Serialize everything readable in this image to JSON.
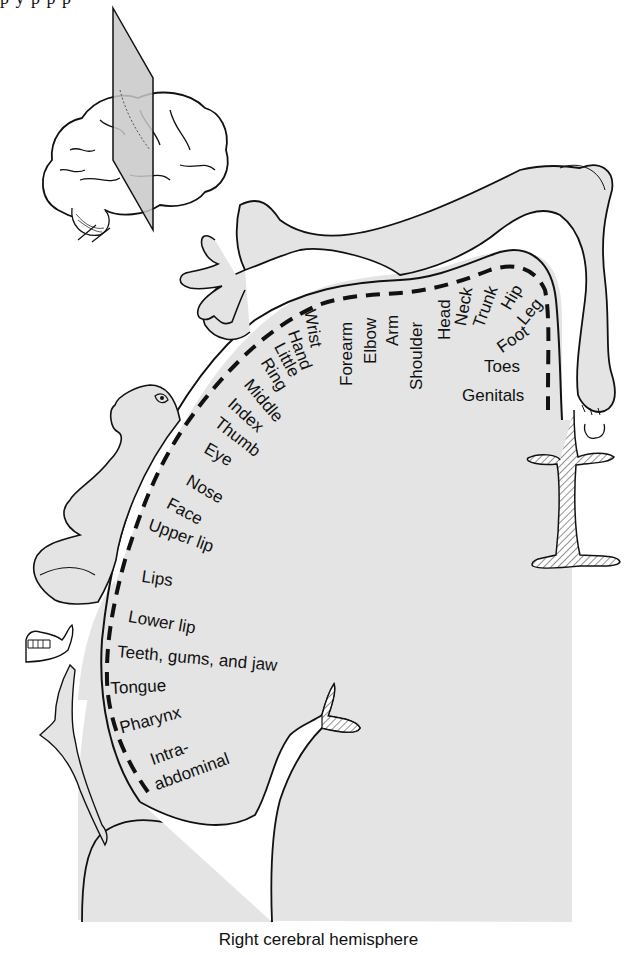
{
  "figure": {
    "caption": "Right cerebral hemisphere",
    "top_cut_text": "p                        y p                     p     p",
    "colors": {
      "cortex_fill": "#e4e4e4",
      "outline": "#111111",
      "background": "#ffffff",
      "plane": "#c8c8c8",
      "label_text": "#111111"
    }
  },
  "inset": {
    "name": "Brain lateral view with coronal plane",
    "plane_label": ""
  },
  "body_map_labels": [
    {
      "id": "genitals",
      "text": "Genitals"
    },
    {
      "id": "toes",
      "text": "Toes"
    },
    {
      "id": "foot",
      "text": "Foot"
    },
    {
      "id": "leg",
      "text": "Leg"
    },
    {
      "id": "hip",
      "text": "Hip"
    },
    {
      "id": "trunk",
      "text": "Trunk"
    },
    {
      "id": "neck",
      "text": "Neck"
    },
    {
      "id": "head",
      "text": "Head"
    },
    {
      "id": "shoulder",
      "text": "Shoulder"
    },
    {
      "id": "arm",
      "text": "Arm"
    },
    {
      "id": "elbow",
      "text": "Elbow"
    },
    {
      "id": "forearm",
      "text": "Forearm"
    },
    {
      "id": "wrist",
      "text": "Wrist"
    },
    {
      "id": "hand",
      "text": "Hand"
    },
    {
      "id": "little",
      "text": "Little"
    },
    {
      "id": "ring",
      "text": "Ring"
    },
    {
      "id": "middle",
      "text": "Middle"
    },
    {
      "id": "index",
      "text": "Index"
    },
    {
      "id": "thumb",
      "text": "Thumb"
    },
    {
      "id": "eye",
      "text": "Eye"
    },
    {
      "id": "nose",
      "text": "Nose"
    },
    {
      "id": "face",
      "text": "Face"
    },
    {
      "id": "upper_lip",
      "text": "Upper lip"
    },
    {
      "id": "lips",
      "text": "Lips"
    },
    {
      "id": "lower_lip",
      "text": "Lower lip"
    },
    {
      "id": "teeth",
      "text": "Teeth, gums, and jaw"
    },
    {
      "id": "tongue",
      "text": "Tongue"
    },
    {
      "id": "pharynx",
      "text": "Pharynx"
    },
    {
      "id": "intra_1",
      "text": "Intra-"
    },
    {
      "id": "intra_2",
      "text": "abdominal"
    }
  ]
}
